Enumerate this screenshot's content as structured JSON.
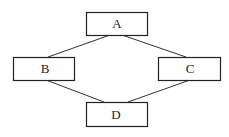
{
  "diagram": {
    "type": "graph",
    "nodes": [
      {
        "id": "A",
        "label": "A",
        "x": 86,
        "y": 12,
        "w": 61,
        "h": 23
      },
      {
        "id": "B",
        "label": "B",
        "x": 13,
        "y": 57,
        "w": 61,
        "h": 23
      },
      {
        "id": "C",
        "label": "C",
        "x": 158,
        "y": 57,
        "w": 62,
        "h": 23
      },
      {
        "id": "D",
        "label": "D",
        "x": 86,
        "y": 102,
        "w": 61,
        "h": 24
      }
    ],
    "edges": [
      {
        "from": "A",
        "to": "B"
      },
      {
        "from": "A",
        "to": "C"
      },
      {
        "from": "B",
        "to": "D"
      },
      {
        "from": "C",
        "to": "D"
      }
    ],
    "colors": {
      "stroke": "#222222",
      "background": "#ffffff"
    }
  }
}
